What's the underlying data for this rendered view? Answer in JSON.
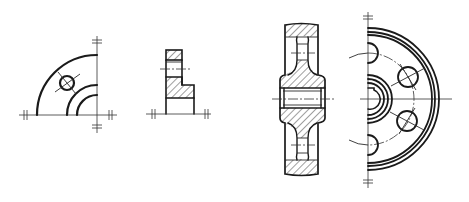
{
  "drawing": {
    "background": "#ffffff",
    "line_color": "#1a1a1a",
    "views": [
      {
        "id": "quarter-flange-view",
        "center": [
          97,
          115
        ],
        "outer_radius": 60,
        "inner_radii": [
          30,
          20
        ],
        "hole": {
          "center": [
            67,
            83
          ],
          "radius": 7
        }
      },
      {
        "id": "l-section-view",
        "baseline_y": 114
      },
      {
        "id": "gear-cross-section-view",
        "centerline_y": 99
      },
      {
        "id": "half-gear-front-view",
        "center": [
          368,
          99
        ],
        "outer_radii": [
          64,
          67,
          71
        ],
        "hub_radii": [
          12,
          16,
          20,
          24
        ],
        "pitch_radius": 46,
        "hole_radius": 10
      }
    ]
  }
}
